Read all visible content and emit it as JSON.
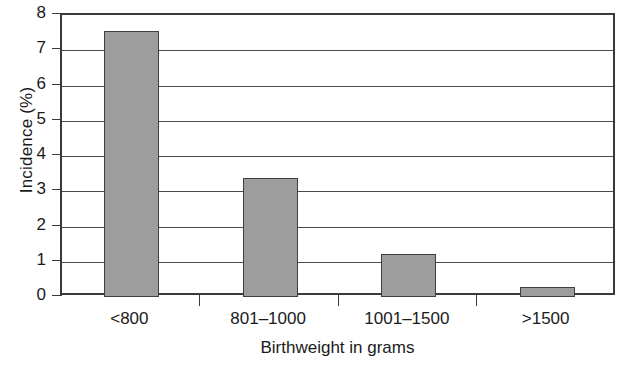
{
  "chart_data": {
    "type": "bar",
    "title": "",
    "xlabel": "Birthweight in grams",
    "ylabel": "Incidence (%)",
    "categories": [
      "<800",
      "801–1000",
      "1001–1500",
      ">1500"
    ],
    "values": [
      7.55,
      3.37,
      1.23,
      0.28
    ],
    "ylim": [
      0,
      8
    ],
    "ytick_labels": [
      "0",
      "1",
      "2",
      "3",
      "4",
      "5",
      "6",
      "7",
      "8"
    ],
    "ytick_values": [
      0,
      1,
      2,
      3,
      4,
      5,
      6,
      7,
      8
    ],
    "grid": "horizontal",
    "legend": "none",
    "bar_fill_color": "#9d9d9d",
    "bar_border_color": "#3f3f3f",
    "axis_color": "#3a3a3a",
    "background_color": "#ffffff"
  }
}
